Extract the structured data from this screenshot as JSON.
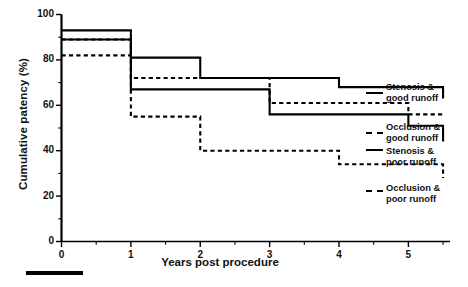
{
  "figure": {
    "background": "#ffffff",
    "line_color": "#000000",
    "axis_color": "#000000"
  },
  "chart_data": {
    "type": "line",
    "title": "",
    "subtitle": "",
    "xlabel": "Years post procedure",
    "ylabel": "Cumulative patency (%)",
    "xlim": [
      0,
      5.6
    ],
    "ylim": [
      0,
      100
    ],
    "grid": false,
    "legend_position": "right",
    "x_ticks": [
      0,
      1,
      2,
      3,
      4,
      5
    ],
    "x_tick_labels": [
      "0",
      "1",
      "2",
      "3",
      "4",
      "5"
    ],
    "x_minor_ticks": [
      0.5,
      1.5,
      2.5,
      3.5,
      4.5,
      5.5
    ],
    "y_ticks": [
      0,
      20,
      40,
      60,
      80,
      100
    ],
    "y_tick_labels": [
      "0",
      "20",
      "40",
      "60",
      "80",
      "100"
    ],
    "y_minor_ticks": [
      10,
      30,
      50,
      70,
      90
    ],
    "step_style": "post",
    "series": [
      {
        "name": "Stenosis & good runoff",
        "style": "solid",
        "x": [
          0,
          0.5,
          1,
          2,
          3,
          4,
          5,
          5.5
        ],
        "values": [
          93,
          93,
          81,
          72,
          72,
          68,
          68,
          63
        ]
      },
      {
        "name": "Occlusion & good runoff",
        "style": "dashed",
        "x": [
          0,
          0.5,
          1,
          2,
          3,
          4,
          5,
          5.5
        ],
        "values": [
          89,
          89,
          72,
          72,
          61,
          61,
          56,
          56
        ]
      },
      {
        "name": "Stenosis & poor runoff",
        "style": "solid",
        "x": [
          0,
          0.5,
          1,
          2,
          3,
          4,
          5,
          5.5
        ],
        "values": [
          89,
          89,
          67,
          67,
          56,
          56,
          51,
          44
        ]
      },
      {
        "name": "Occlusion & poor runoff",
        "style": "dashed",
        "x": [
          0,
          0.5,
          1,
          2,
          3,
          4,
          5,
          5.5
        ],
        "values": [
          82,
          82,
          55,
          40,
          40,
          34,
          34,
          28
        ]
      }
    ],
    "legend_entries": [
      {
        "line1": "Stenosis &",
        "line2": "good runoff",
        "style": "solid"
      },
      {
        "line1": "Occlusion &",
        "line2": "good runoff",
        "style": "dashed"
      },
      {
        "line1": "Stenosis &",
        "line2": "poor runoff",
        "style": "solid"
      },
      {
        "line1": "Occlusion &",
        "line2": "poor runoff",
        "style": "dashed"
      }
    ]
  },
  "annotations": {
    "scale_bar": ""
  }
}
